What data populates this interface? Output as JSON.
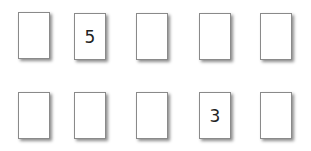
{
  "rows": [
    {
      "cards": [
        {
          "value": ""
        },
        {
          "value": "5"
        },
        {
          "value": ""
        },
        {
          "value": ""
        },
        {
          "value": ""
        }
      ]
    },
    {
      "cards": [
        {
          "value": ""
        },
        {
          "value": ""
        },
        {
          "value": ""
        },
        {
          "value": "3"
        },
        {
          "value": ""
        }
      ]
    }
  ]
}
